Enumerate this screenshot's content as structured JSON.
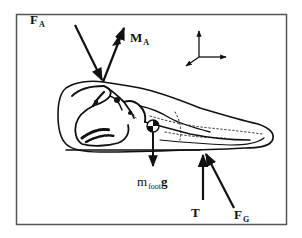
{
  "figure": {
    "colors": {
      "line": "#111111",
      "frame": "#555555",
      "background": "#ffffff"
    }
  },
  "labels": {
    "fa": {
      "main": "F",
      "sub": "A"
    },
    "ma": {
      "main": "M",
      "sub": "A"
    },
    "mg": {
      "main": "m",
      "sub": "foot",
      "tail": "g"
    },
    "t": {
      "main": "T"
    },
    "fg": {
      "main": "F",
      "sub": "G"
    }
  },
  "vectors": [
    {
      "name": "ankle-force",
      "label": "F_A",
      "from": [
        75,
        25
      ],
      "to": [
        103,
        82
      ],
      "type": "force"
    },
    {
      "name": "ankle-moment",
      "label": "M_A",
      "from": [
        103,
        82
      ],
      "to": [
        124,
        27
      ],
      "type": "moment"
    },
    {
      "name": "weight",
      "label": "m_foot g",
      "from": [
        153,
        126
      ],
      "to": [
        153,
        165
      ],
      "type": "force"
    },
    {
      "name": "tendon-force",
      "label": "T",
      "from": [
        203,
        200
      ],
      "to": [
        203,
        156
      ],
      "type": "force"
    },
    {
      "name": "ground-force",
      "label": "F_G",
      "from": [
        234,
        208
      ],
      "to": [
        206,
        154
      ],
      "type": "force"
    }
  ],
  "axes": {
    "origin": [
      199,
      57
    ],
    "directions": [
      "up",
      "right",
      "down-left"
    ]
  }
}
